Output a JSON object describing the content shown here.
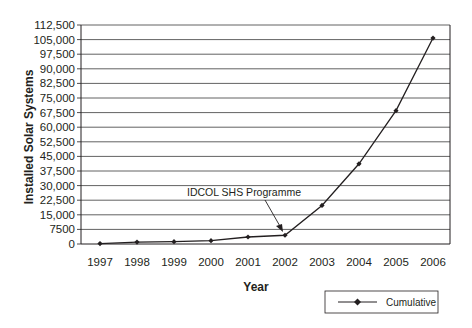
{
  "chart_data": {
    "type": "line",
    "title": "",
    "xlabel": "Year",
    "ylabel": "Installed Solar Systems",
    "categories": [
      "1997",
      "1998",
      "1999",
      "2000",
      "2001",
      "2002",
      "2003",
      "2004",
      "2005",
      "2006"
    ],
    "series": [
      {
        "name": "Cumulative",
        "values": [
          200,
          1000,
          1200,
          1700,
          3600,
          4500,
          19800,
          41200,
          68500,
          105800
        ],
        "marker": "diamond",
        "color": "#231f20"
      }
    ],
    "yticks": [
      0,
      7500,
      15000,
      22500,
      30000,
      37500,
      45000,
      52500,
      60000,
      67500,
      75000,
      82500,
      90000,
      97500,
      105000,
      112500
    ],
    "ytick_labels": [
      "0",
      "7500",
      "15,000",
      "22,500",
      "30,000",
      "37,500",
      "45,000",
      "52,500",
      "60,000",
      "67,500",
      "75,000",
      "82,500",
      "90,000",
      "97,500",
      "105,000",
      "112,500"
    ],
    "ylim": [
      0,
      112500
    ],
    "grid": true,
    "legend_position": "bottom-right",
    "annotations": [
      {
        "text": "IDCOL SHS Programme",
        "points_to": "2002"
      }
    ]
  },
  "legend": {
    "label": "Cumulative"
  },
  "annotation": {
    "text": "IDCOL SHS Programme"
  },
  "axes": {
    "xlabel": "Year",
    "ylabel": "Installed Solar Systems"
  }
}
